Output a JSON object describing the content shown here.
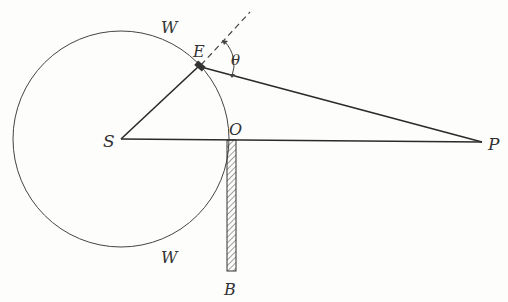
{
  "diagram": {
    "labels": {
      "S": "S",
      "E": "E",
      "O": "O",
      "P": "P",
      "B": "B",
      "W_top": "W",
      "W_bottom": "W",
      "theta": "θ"
    },
    "colors": {
      "ink": "#2a2a2a",
      "background": "#fdfdfb"
    }
  }
}
